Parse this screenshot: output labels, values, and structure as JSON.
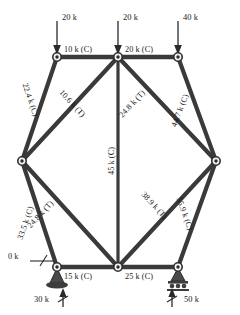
{
  "figure": {
    "type": "truss-force-diagram",
    "title": "",
    "units": "k",
    "colors": {
      "member": "#3a3a3a",
      "joint_fill": "#f2f2f2",
      "joint_core": "#2b2b2b",
      "text": "#1a1a1a",
      "support": "#4a4a4a",
      "background": "#ffffff"
    }
  },
  "applied_loads": [
    {
      "id": "load-top-left",
      "value": "20 k",
      "at_node": "top-left",
      "direction": "down"
    },
    {
      "id": "load-top-center",
      "value": "20 k",
      "at_node": "top-center",
      "direction": "down"
    },
    {
      "id": "load-top-right",
      "value": "40 k",
      "at_node": "top-right",
      "direction": "down"
    }
  ],
  "reactions": [
    {
      "id": "reaction-left",
      "value": "30 k",
      "at_node": "bottom-left",
      "direction": "up",
      "support": "pin"
    },
    {
      "id": "reaction-right",
      "value": "50 k",
      "at_node": "bottom-right",
      "direction": "up",
      "support": "roller"
    }
  ],
  "members": [
    {
      "id": "member-top-left-chord",
      "label": "10 k (C)",
      "force": 10.0,
      "state": "C"
    },
    {
      "id": "member-top-right-chord",
      "label": "20 k (C)",
      "force": 20.0,
      "state": "C"
    },
    {
      "id": "member-upper-left-incline",
      "label": "22.4 k (C)",
      "force": 22.4,
      "state": "C"
    },
    {
      "id": "member-diagonal-upper-left",
      "label": "10.6 k (T)",
      "force": 10.6,
      "state": "T"
    },
    {
      "id": "member-diagonal-upper-right",
      "label": "24.8 k (T)",
      "force": 24.8,
      "state": "T"
    },
    {
      "id": "member-upper-right-incline",
      "label": "44.7 k (C)",
      "force": 44.7,
      "state": "C"
    },
    {
      "id": "member-center-vertical",
      "label": "45 k (C)",
      "force": 45.0,
      "state": "C"
    },
    {
      "id": "member-lower-left-incline",
      "label": "33.5 k (C)",
      "force": 33.5,
      "state": "C"
    },
    {
      "id": "member-diagonal-lower-left",
      "label": "24.8 k (T)",
      "force": 24.8,
      "state": "T"
    },
    {
      "id": "member-diagonal-lower-right",
      "label": "38.9 k (T)",
      "force": 38.9,
      "state": "T"
    },
    {
      "id": "member-lower-right-incline",
      "label": "55.9 k (C)",
      "force": 55.9,
      "state": "C"
    },
    {
      "id": "member-bottom-left-chord",
      "label": "15 k (C)",
      "force": 15.0,
      "state": "C"
    },
    {
      "id": "member-bottom-right-chord",
      "label": "25 k (C)",
      "force": 25.0,
      "state": "C"
    },
    {
      "id": "member-zero-force",
      "label": "0 k",
      "force": 0.0,
      "state": "zero"
    }
  ],
  "nodes": [
    {
      "id": "top-left",
      "x": 57,
      "y": 57
    },
    {
      "id": "top-center",
      "x": 118,
      "y": 57
    },
    {
      "id": "top-right",
      "x": 178,
      "y": 57
    },
    {
      "id": "left",
      "x": 22,
      "y": 161
    },
    {
      "id": "right",
      "x": 216,
      "y": 161
    },
    {
      "id": "bottom-left",
      "x": 57,
      "y": 267
    },
    {
      "id": "bottom-center",
      "x": 118,
      "y": 267
    },
    {
      "id": "bottom-right",
      "x": 178,
      "y": 267
    }
  ]
}
